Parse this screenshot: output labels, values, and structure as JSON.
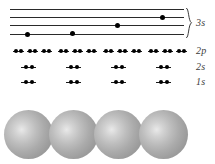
{
  "figure": {
    "background_color": "#ffffff",
    "label_color": "#3b3b3b",
    "line_color": "#2a2a2a",
    "dot_color": "#000000",
    "sphere_color": "#a8a8a8",
    "atom_count": 4
  },
  "levels": [
    {
      "id": "3s",
      "label": "3s",
      "label_x": 196,
      "label_y": 18,
      "type": "band",
      "braced": true,
      "line_count": 4,
      "lines": [
        {
          "y": 9,
          "x1": 10,
          "x2": 184,
          "electron_dots": []
        },
        {
          "y": 17,
          "x1": 10,
          "x2": 184,
          "electron_dots": [
            163
          ]
        },
        {
          "y": 25,
          "x1": 10,
          "x2": 184,
          "electron_dots": [
            118
          ]
        },
        {
          "y": 33,
          "x1": 10,
          "x2": 184,
          "electron_dots": [
            73
          ]
        }
      ],
      "extra_bottom_line": {
        "y": 36,
        "x1": 10,
        "x2": 184,
        "electron_dots": [
          28
        ]
      }
    },
    {
      "id": "2p",
      "label": "2p",
      "label_x": 196,
      "label_y": 47,
      "type": "orbital-row",
      "y": 51,
      "orbital_width": 11,
      "electrons_per_orbital": 2,
      "groups": [
        {
          "atom": 1,
          "orbital_x": [
            13,
            27,
            41
          ]
        },
        {
          "atom": 2,
          "orbital_x": [
            58,
            72,
            86
          ]
        },
        {
          "atom": 3,
          "orbital_x": [
            103,
            117,
            131
          ]
        },
        {
          "atom": 4,
          "orbital_x": [
            148,
            162,
            176
          ]
        }
      ]
    },
    {
      "id": "2s",
      "label": "2s",
      "label_x": 196,
      "label_y": 63,
      "type": "orbital-row",
      "y": 67,
      "orbital_width": 15,
      "electrons_per_orbital": 2,
      "groups": [
        {
          "atom": 1,
          "orbital_x": [
            21
          ]
        },
        {
          "atom": 2,
          "orbital_x": [
            66
          ]
        },
        {
          "atom": 3,
          "orbital_x": [
            111
          ]
        },
        {
          "atom": 4,
          "orbital_x": [
            156
          ]
        }
      ]
    },
    {
      "id": "1s",
      "label": "1s",
      "label_x": 196,
      "label_y": 78,
      "type": "orbital-row",
      "y": 82,
      "orbital_width": 15,
      "electrons_per_orbital": 2,
      "groups": [
        {
          "atom": 1,
          "orbital_x": [
            21
          ]
        },
        {
          "atom": 2,
          "orbital_x": [
            66
          ]
        },
        {
          "atom": 3,
          "orbital_x": [
            111
          ]
        },
        {
          "atom": 4,
          "orbital_x": [
            156
          ]
        }
      ]
    }
  ],
  "atoms": [
    {
      "index": 1,
      "center_x": 28,
      "center_y": 134,
      "diameter": 49
    },
    {
      "index": 2,
      "center_x": 73,
      "center_y": 134,
      "diameter": 49
    },
    {
      "index": 3,
      "center_x": 118,
      "center_y": 134,
      "diameter": 49
    },
    {
      "index": 4,
      "center_x": 163,
      "center_y": 134,
      "diameter": 49
    }
  ]
}
